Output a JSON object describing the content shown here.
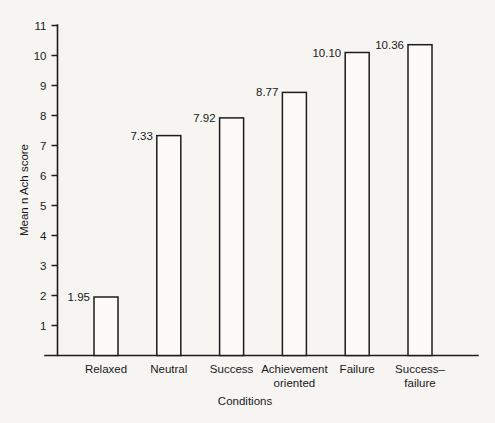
{
  "chart_data": {
    "type": "bar",
    "title": "",
    "subtitle": "",
    "xlabel": "Conditions",
    "ylabel": "Mean n Ach score",
    "categories": [
      "Relaxed",
      "Neutral",
      "Success",
      "Achievement oriented",
      "Failure",
      "Success–failure"
    ],
    "category_lines": [
      [
        "Relaxed"
      ],
      [
        "Neutral"
      ],
      [
        "Success"
      ],
      [
        "Achievement",
        "oriented"
      ],
      [
        "Failure"
      ],
      [
        "Success–",
        "failure"
      ]
    ],
    "values": [
      1.95,
      7.33,
      7.92,
      8.77,
      10.1,
      10.36
    ],
    "value_labels": [
      "1.95",
      "7.33",
      "7.92",
      "8.77",
      "10.10",
      "10.36"
    ],
    "ylim": [
      0,
      11
    ],
    "ytick_values": [
      1,
      2,
      3,
      4,
      5,
      6,
      7,
      8,
      9,
      10,
      11
    ],
    "ytick_labels": [
      "1",
      "2",
      "3",
      "4",
      "5",
      "6",
      "7",
      "8",
      "9",
      "10",
      "11"
    ],
    "grid": false,
    "legend": false,
    "legend_position": "none",
    "bar_style": "outline",
    "colors": {
      "background": "#f6f5f2",
      "bar_fill": "#fcfbf9",
      "bar_stroke": "#1d1d1d",
      "axis": "#1d1d1d",
      "text": "#1a1a1a"
    }
  },
  "figure": {
    "y_axis_title": "Mean n Ach score",
    "x_axis_title": "Conditions"
  }
}
